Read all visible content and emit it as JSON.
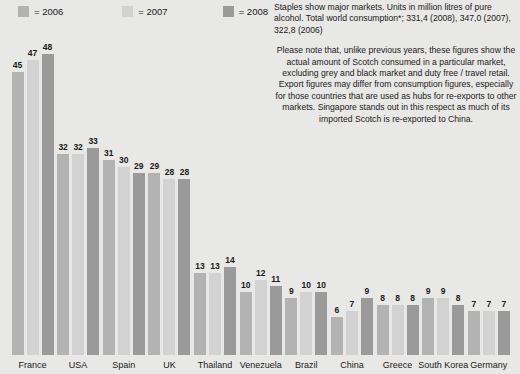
{
  "legend": {
    "items": [
      {
        "label": "= 2006",
        "color": "#b3b3b3",
        "swatch_name": "legend-swatch-2006"
      },
      {
        "label": "= 2007",
        "color": "#d2d2d2",
        "swatch_name": "legend-swatch-2007"
      },
      {
        "label": "= 2008",
        "color": "#9a9a9a",
        "swatch_name": "legend-swatch-2008"
      }
    ]
  },
  "notes": {
    "header": "Staples show major markets. Units in million litres of pure alcohol. Total world consumption*; 331,4 (2008), 347,0 (2007), 322,8 (2006)",
    "body": "Please note that, unlike previous years, these figures show the actual amount of Scotch consumed in a particular market, excluding grey and black market and duty free / travel retail. Export figures may differ from consumption figures, especially for those countries that are used as hubs for re-exports to other markets. Singapore  stands out in this respect as much of its imported Scotch is re-exported to China."
  },
  "chart_data": {
    "type": "bar",
    "title": "",
    "xlabel": "",
    "ylabel": "Million litres of pure alcohol",
    "ylim": [
      0,
      50
    ],
    "grid": false,
    "legend_position": "top-left",
    "categories": [
      "France",
      "USA",
      "Spain",
      "UK",
      "Thailand",
      "Venezuela",
      "Brazil",
      "China",
      "Greece",
      "South Korea",
      "Germany"
    ],
    "series": [
      {
        "name": "2006",
        "color": "#b3b3b3",
        "values": [
          45,
          32,
          31,
          29,
          13,
          10,
          9,
          6,
          8,
          9,
          7
        ]
      },
      {
        "name": "2007",
        "color": "#d2d2d2",
        "values": [
          47,
          32,
          30,
          28,
          13,
          12,
          10,
          7,
          8,
          9,
          7
        ]
      },
      {
        "name": "2008",
        "color": "#9a9a9a",
        "values": [
          48,
          33,
          29,
          28,
          14,
          11,
          10,
          9,
          8,
          8,
          7
        ]
      }
    ]
  }
}
